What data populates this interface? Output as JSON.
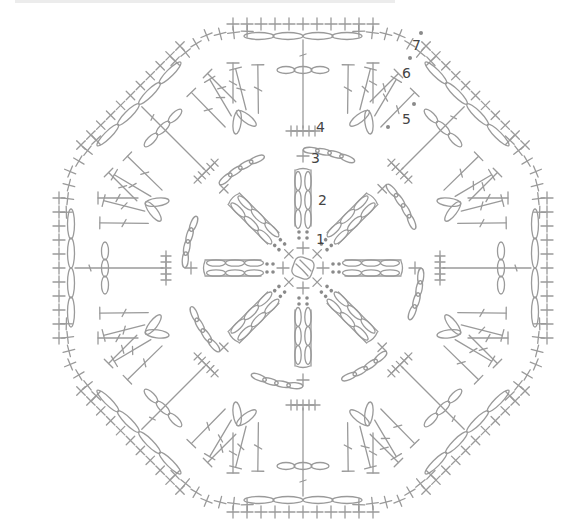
{
  "diagram": {
    "type": "crochet-chart",
    "shape": "octagon",
    "stroke_color": "#9a9a9a",
    "dot_color": "#8a8a8a",
    "label_color": "#444444",
    "center": [
      303,
      268
    ],
    "round_labels": [
      {
        "text": "1",
        "x": 316,
        "y": 232
      },
      {
        "text": "2",
        "x": 318,
        "y": 193
      },
      {
        "text": "3",
        "x": 311,
        "y": 151
      },
      {
        "text": "4",
        "x": 316,
        "y": 120
      },
      {
        "text": "5",
        "x": 402,
        "y": 112
      },
      {
        "text": "6",
        "x": 402,
        "y": 66
      },
      {
        "text": "7",
        "x": 412,
        "y": 38
      }
    ]
  }
}
